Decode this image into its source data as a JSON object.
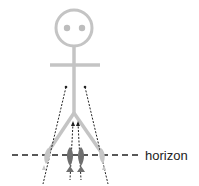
{
  "diagram": {
    "label_horizon": "horizon",
    "colors": {
      "figure": "#c4c4c4",
      "eyes": "#bdbdbd",
      "inner_feet": "#6f6f6f",
      "outer_feet": "#c6c6c6",
      "dashed_line": "#222222",
      "dotted_arrows": "#222222"
    },
    "elements": {
      "head": "stick-figure-head",
      "body": "stick-figure-body",
      "arms": "stick-figure-arms",
      "legs": "two-legs-diverging",
      "feet_outer": 2,
      "feet_inner": 2,
      "dotted_arrows": 4
    }
  }
}
